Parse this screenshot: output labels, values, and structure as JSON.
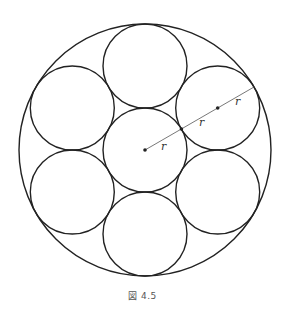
{
  "figure": {
    "caption": "図 4.5",
    "outer_circle": {
      "cx": 145,
      "cy": 150,
      "r": 126
    },
    "inner_radius": 42,
    "labels": {
      "r1": "r",
      "r2": "r",
      "r3": "r"
    },
    "colors": {
      "stroke": "#222222",
      "radius_line": "#555555"
    }
  }
}
